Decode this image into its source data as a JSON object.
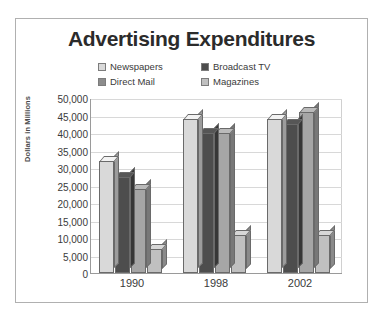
{
  "chart_data": {
    "type": "bar",
    "title": "Advertising Expenditures",
    "xlabel": "",
    "ylabel": "Dollars in Millions",
    "categories": [
      "1990",
      "1998",
      "2002"
    ],
    "series": [
      {
        "name": "Newspapers",
        "color": "#d9d9d9",
        "values": [
          32000,
          44000,
          44000
        ]
      },
      {
        "name": "Broadcast TV",
        "color": "#4d4d4d",
        "values": [
          27500,
          40000,
          42500
        ]
      },
      {
        "name": "Direct Mail",
        "color": "#a6a6a6",
        "values": [
          24000,
          40000,
          46000
        ]
      },
      {
        "name": "Magazines",
        "color": "#c0c0c0",
        "values": [
          7000,
          11000,
          11000
        ]
      }
    ],
    "ylim": [
      0,
      50000
    ],
    "ytick_step": 5000,
    "ytick_labels": [
      "50,000",
      "45,000",
      "40,000",
      "35,000",
      "30,000",
      "25,000",
      "20,000",
      "15,000",
      "10,000",
      "5,000",
      "0"
    ],
    "grid": true,
    "legend_position": "top-center"
  },
  "legend": {
    "items": [
      {
        "label": "Newspapers",
        "color": "#d9d9d9"
      },
      {
        "label": "Broadcast TV",
        "color": "#4d4d4d"
      },
      {
        "label": "Direct Mail",
        "color": "#8c8c8c"
      },
      {
        "label": "Magazines",
        "color": "#c0c0c0"
      }
    ]
  },
  "colors": {
    "frame_border": "#b0b0b0",
    "axis": "#9a9a9a",
    "gridline": "#d8d8d8",
    "text": "#3a3a3a",
    "background": "#ffffff"
  }
}
